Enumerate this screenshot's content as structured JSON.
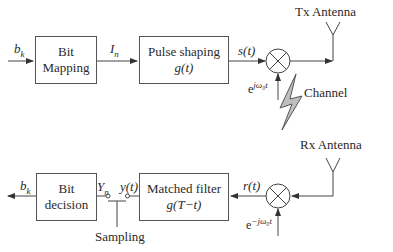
{
  "diagram": {
    "tx": {
      "input_label": "b_k",
      "input_label_main": "b",
      "input_label_sub": "k",
      "bit_mapping": {
        "line1": "Bit",
        "line2": "Mapping"
      },
      "symbol_label_main": "I",
      "symbol_label_sub": "n",
      "pulse_shaping": {
        "line1": "Pulse shaping",
        "line2": "g(t)"
      },
      "signal_label": "s(t)",
      "carrier_label_base": "e",
      "carrier_label_exp": "jω₀t",
      "antenna_label": "Tx Antenna"
    },
    "channel": {
      "label": "Channel"
    },
    "rx": {
      "antenna_label": "Rx Antenna",
      "signal_label": "r(t)",
      "carrier_label_base": "e",
      "carrier_label_exp": "−jω₀t",
      "matched_filter": {
        "line1": "Matched filter",
        "line2": "g(T−t)"
      },
      "filter_output_label": "y(t)",
      "sample_label_main": "Y",
      "sample_label_sub": "n",
      "sampling_label": "Sampling",
      "bit_decision": {
        "line1": "Bit",
        "line2": "decision"
      },
      "output_label_main": "b",
      "output_label_sub": "k"
    }
  }
}
